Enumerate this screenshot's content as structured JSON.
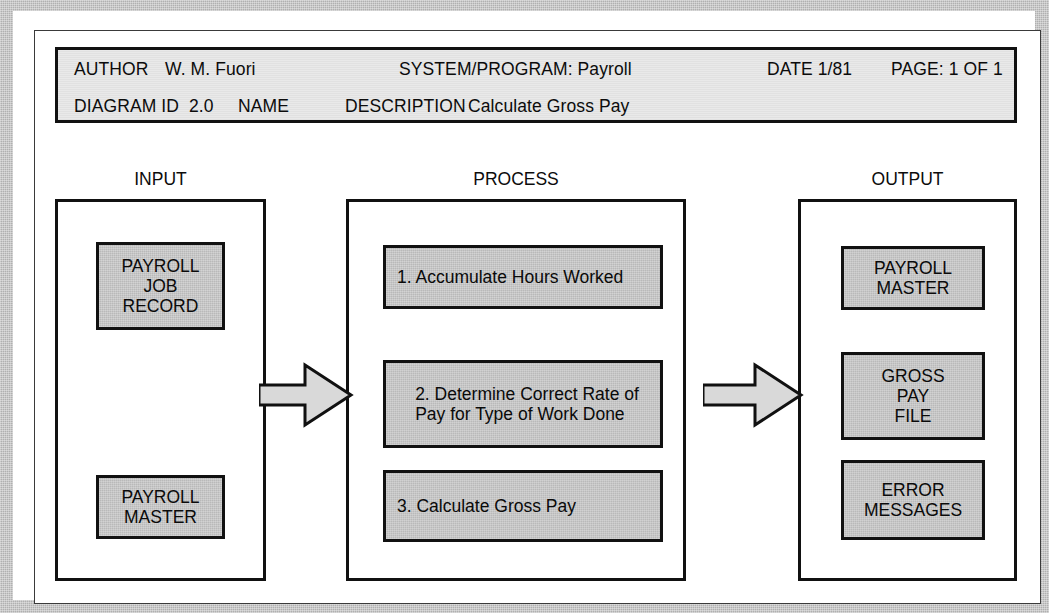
{
  "header": {
    "author_label": "AUTHOR",
    "author_value": "W. M. Fuori",
    "system_program": "SYSTEM/PROGRAM: Payroll",
    "date": "DATE 1/81",
    "page": "PAGE: 1 OF 1",
    "diagram_id_label": "DIAGRAM ID",
    "diagram_id_value": "2.0",
    "name_label": "NAME",
    "description_label": "DESCRIPTION",
    "description_value": "Calculate Gross Pay"
  },
  "columns": {
    "input": {
      "caption": "INPUT",
      "boxes": [
        {
          "text": "PAYROLL\nJOB\nRECORD"
        },
        {
          "text": "PAYROLL\nMASTER"
        }
      ]
    },
    "process": {
      "caption": "PROCESS",
      "boxes": [
        {
          "text": "1. Accumulate Hours Worked"
        },
        {
          "text": "2. Determine Correct Rate of\n    Pay  for Type of Work Done"
        },
        {
          "text": "3. Calculate Gross Pay"
        }
      ]
    },
    "output": {
      "caption": "OUTPUT",
      "boxes": [
        {
          "text": "PAYROLL\nMASTER"
        },
        {
          "text": "GROSS\nPAY\nFILE"
        },
        {
          "text": "ERROR\nMESSAGES"
        }
      ]
    }
  },
  "arrows": [
    {
      "name": "input-to-process-arrow"
    },
    {
      "name": "process-to-output-arrow"
    }
  ],
  "colors": {
    "box_fill": "#b9b9b9",
    "header_fill": "#e9e9e9",
    "outline": "#111111",
    "scan_border": "#b0b0b0",
    "page": "#ffffff",
    "text": "#0a0a0a"
  }
}
